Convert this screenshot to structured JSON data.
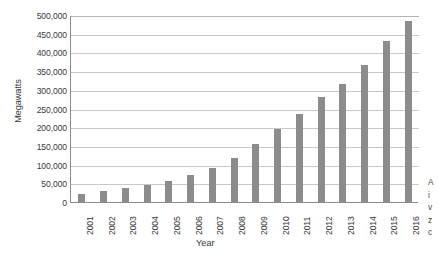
{
  "chart_data": {
    "type": "bar",
    "title": "",
    "xlabel": "Year",
    "ylabel": "Megawatts",
    "categories": [
      "2001",
      "2002",
      "2003",
      "2004",
      "2005",
      "2006",
      "2007",
      "2008",
      "2009",
      "2010",
      "2011",
      "2012",
      "2013",
      "2014",
      "2015",
      "2016"
    ],
    "values": [
      24000,
      31000,
      39000,
      47000,
      59000,
      74000,
      94000,
      121000,
      159000,
      198000,
      238000,
      283000,
      318000,
      370000,
      433000,
      487000
    ],
    "ylim": [
      0,
      500000
    ],
    "ytick_values": [
      0,
      50000,
      100000,
      150000,
      200000,
      250000,
      300000,
      350000,
      400000,
      450000,
      500000
    ],
    "ytick_labels": [
      "0",
      "50,000",
      "100,000",
      "150,000",
      "200,000",
      "250,000",
      "300,000",
      "350,000",
      "400,000",
      "450,000",
      "500,000"
    ],
    "grid": true,
    "legend": "none",
    "bar_color": "#8c8c8c",
    "gridline_color": "#c9c9c9",
    "axis_color": "#8a8a8a"
  },
  "side_caption": {
    "lines": [
      "A",
      "i",
      "v",
      "z",
      "c"
    ]
  }
}
